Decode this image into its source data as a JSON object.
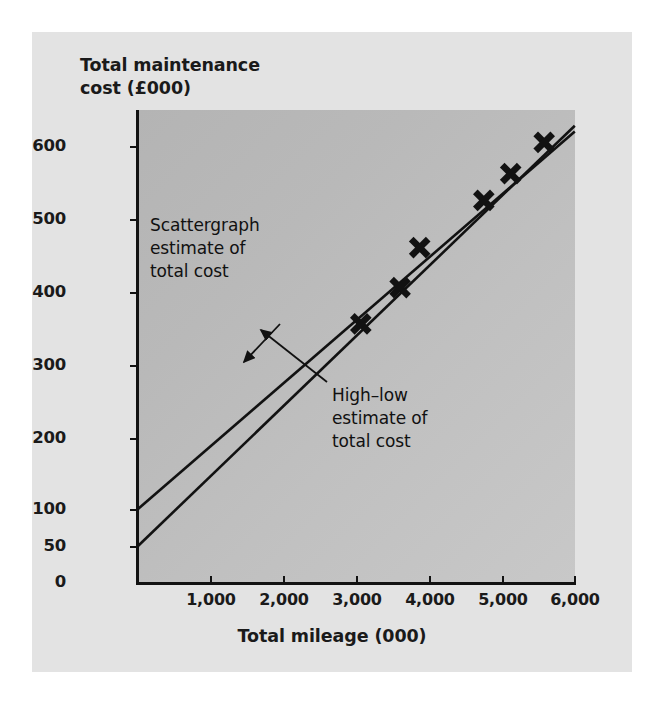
{
  "chart_data": {
    "type": "scatter",
    "title": "",
    "xlabel": "Total mileage (000)",
    "ylabel": "Total maintenance\ncost (£000)",
    "xlim": [
      0,
      6000
    ],
    "ylim": [
      0,
      640
    ],
    "grid": false,
    "legend": "none",
    "xticks": [
      1000,
      2000,
      3000,
      4000,
      5000,
      6000
    ],
    "xtick_labels": [
      "1,000",
      "2,000",
      "3,000",
      "4,000",
      "5,000",
      "6,000"
    ],
    "yticks": [
      0,
      50,
      100,
      200,
      300,
      400,
      500,
      600
    ],
    "ytick_labels": [
      "0",
      "50",
      "100",
      "200",
      "300",
      "400",
      "500",
      "600"
    ],
    "points": [
      {
        "x": 3060,
        "y": 355
      },
      {
        "x": 3600,
        "y": 405
      },
      {
        "x": 3870,
        "y": 460
      },
      {
        "x": 4750,
        "y": 525
      },
      {
        "x": 5120,
        "y": 562
      },
      {
        "x": 5580,
        "y": 605
      }
    ],
    "marker": "x-cross",
    "series": [
      {
        "name": "Scattergraph estimate of total cost",
        "type": "line",
        "intercept": 100,
        "x_start": 0,
        "y_start": 100,
        "x_end": 6000,
        "y_end": 620
      },
      {
        "name": "High-low estimate of total cost",
        "type": "line",
        "intercept": 50,
        "x_start": 0,
        "y_start": 50,
        "x_end": 6000,
        "y_end": 628
      }
    ],
    "annotations": [
      {
        "id": "scattergraph",
        "text": "Scattergraph\nestimate of\ntotal cost",
        "points_to_x": 2620,
        "points_to_y": 330
      },
      {
        "id": "high-low",
        "text": "High–low\nestimate of\ntotal cost",
        "points_to_x": 2700,
        "points_to_y": 315
      }
    ]
  },
  "axes": {
    "y_title": "Total maintenance\ncost (£000)",
    "x_title": "Total mileage (000)",
    "y_ticks": [
      {
        "label": "600",
        "value": 600
      },
      {
        "label": "500",
        "value": 500
      },
      {
        "label": "400",
        "value": 400
      },
      {
        "label": "300",
        "value": 300
      },
      {
        "label": "200",
        "value": 200
      },
      {
        "label": "100",
        "value": 100
      },
      {
        "label": "50",
        "value": 50
      },
      {
        "label": "0",
        "value": 0
      }
    ],
    "x_ticks": [
      {
        "label": "1,000",
        "value": 1000
      },
      {
        "label": "2,000",
        "value": 2000
      },
      {
        "label": "3,000",
        "value": 3000
      },
      {
        "label": "4,000",
        "value": 4000
      },
      {
        "label": "5,000",
        "value": 5000
      },
      {
        "label": "6,000",
        "value": 6000
      }
    ]
  },
  "annotations": {
    "scattergraph": "Scattergraph\nestimate of\ntotal cost",
    "high_low": "High–low\nestimate of\ntotal cost"
  },
  "colors": {
    "figure_background": "#e3e3e3",
    "panel_background": "#bcbcbc",
    "ink": "#121212",
    "text": "#1a1a1a"
  }
}
